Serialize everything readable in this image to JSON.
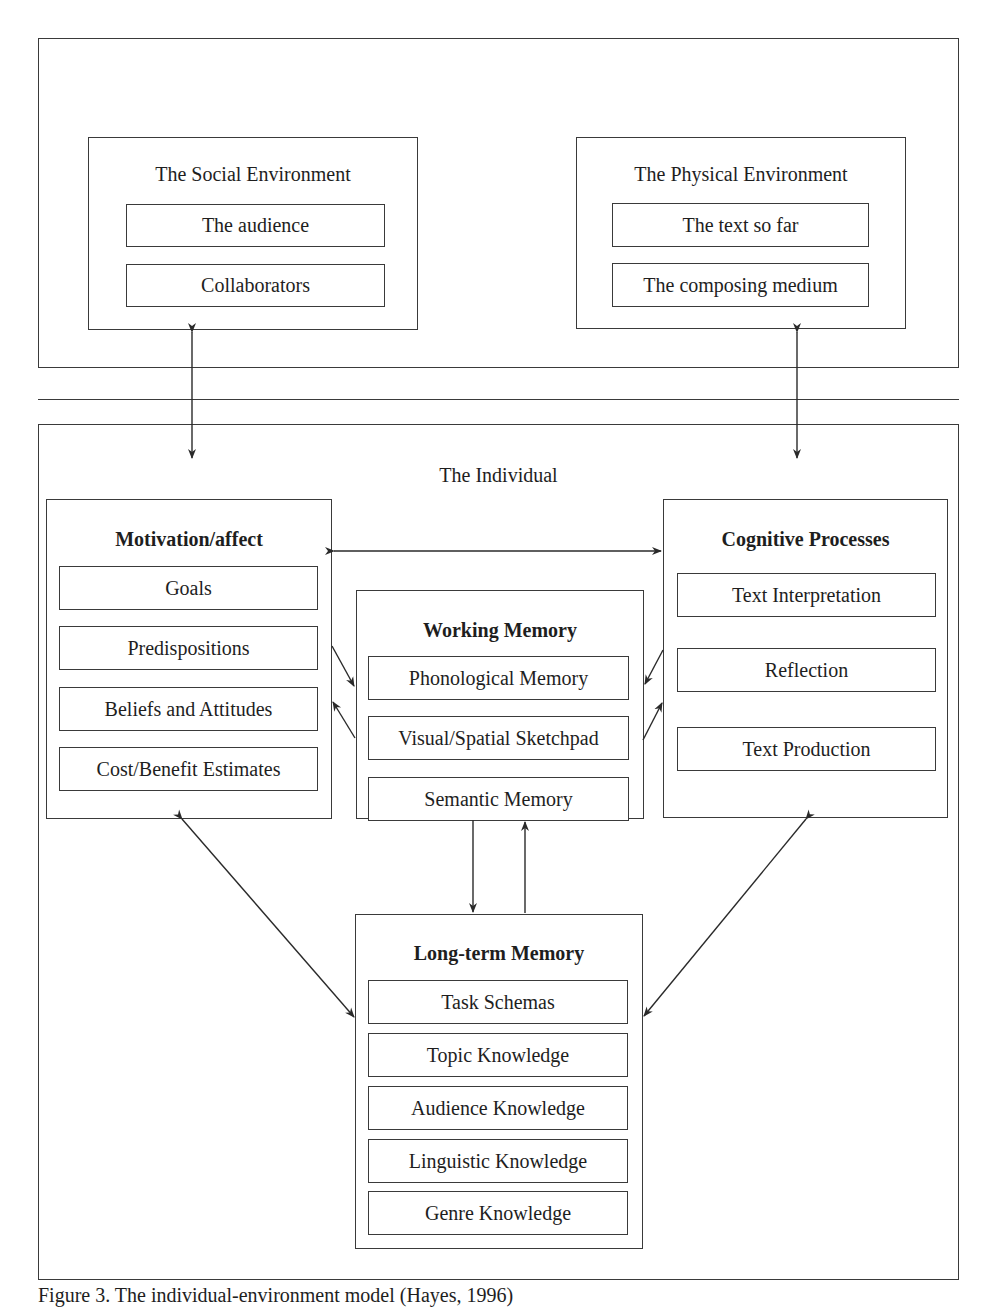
{
  "environment": {
    "social": {
      "title": "The Social Environment",
      "items": [
        "The audience",
        "Collaborators"
      ]
    },
    "physical": {
      "title": "The Physical Environment",
      "items": [
        "The text so far",
        "The composing medium"
      ]
    }
  },
  "individual": {
    "title": "The Individual",
    "motivation": {
      "title": "Motivation/affect",
      "items": [
        "Goals",
        "Predispositions",
        "Beliefs and Attitudes",
        "Cost/Benefit Estimates"
      ]
    },
    "working_memory": {
      "title": "Working Memory",
      "items": [
        "Phonological Memory",
        "Visual/Spatial Sketchpad",
        "Semantic Memory"
      ]
    },
    "cognitive": {
      "title": "Cognitive Processes",
      "items": [
        "Text Interpretation",
        "Reflection",
        "Text Production"
      ]
    },
    "long_term_memory": {
      "title": "Long-term Memory",
      "items": [
        "Task Schemas",
        "Topic Knowledge",
        "Audience Knowledge",
        "Linguistic Knowledge",
        "Genre Knowledge"
      ]
    }
  },
  "caption": "Figure 3. The individual-environment model (Hayes, 1996)"
}
